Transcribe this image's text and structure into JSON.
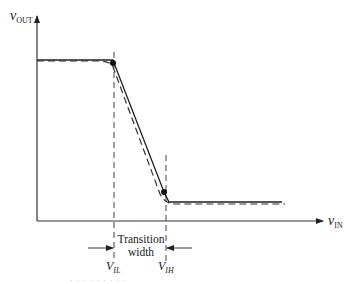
{
  "diagram": {
    "type": "inverter voltage transfer characteristic",
    "y_axis": {
      "symbol": "v",
      "subscript": "OUT"
    },
    "x_axis": {
      "symbol": "v",
      "subscript": "IN"
    },
    "markers": [
      {
        "symbol": "V",
        "subscript": "IL"
      },
      {
        "symbol": "V",
        "subscript": "IH"
      }
    ],
    "transition_label": {
      "line1": "Transition",
      "line2": "width"
    },
    "curves": [
      {
        "name": "piecewise-linear",
        "style": "solid"
      },
      {
        "name": "actual",
        "style": "dashed"
      }
    ],
    "colors": {
      "ink": "#222222",
      "background": "#ffffff"
    }
  },
  "footnote": "· · · · · · · · ·"
}
